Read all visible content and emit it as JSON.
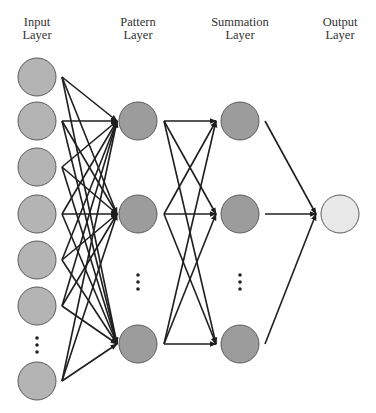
{
  "layers": [
    {
      "id": "input",
      "label_line1": "Input",
      "label_line2": "Layer",
      "x": 37
    },
    {
      "id": "pattern",
      "label_line1": "Pattern",
      "label_line2": "Layer",
      "x": 138
    },
    {
      "id": "summation",
      "label_line1": "Summation",
      "label_line2": "Layer",
      "x": 240
    },
    {
      "id": "output",
      "label_line1": "Output",
      "label_line2": "Layer",
      "x": 340
    }
  ],
  "colors": {
    "input_node": "#b4b4b4",
    "pattern_node": "#9c9c9c",
    "summation_node": "#9c9c9c",
    "output_node": "#e8e8e8",
    "node_stroke": "#5a5a5a",
    "edge": "#1e1e1e",
    "label": "#333333"
  },
  "node_radius": 19,
  "nodes": {
    "input": [
      77,
      121,
      167,
      214,
      260,
      306,
      381
    ],
    "input_ellipsis_y": 345,
    "pattern": [
      121,
      214,
      344
    ],
    "pattern_ellipsis_y": 282,
    "summation": [
      121,
      214,
      344
    ],
    "summation_ellipsis_y": 282,
    "output": [
      214
    ]
  },
  "edges": {
    "input_to_pattern": {
      "x_start": 62,
      "x_end": 117
    },
    "pattern_to_summation": {
      "x_start": 164,
      "x_end": 216
    },
    "summation_to_output": {
      "x_start": 265,
      "x_end": 316
    }
  }
}
